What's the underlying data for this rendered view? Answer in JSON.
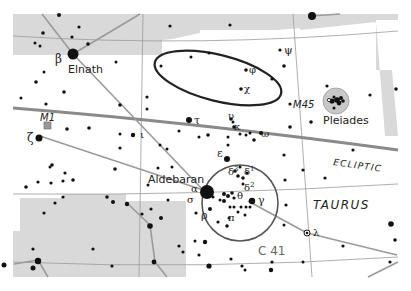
{
  "map": {
    "constellation": "TAURUS",
    "ecliptic_label": "ECLIPTIC",
    "colors": {
      "background": "#ffffff",
      "neighbor_region": "#d9d9d9",
      "grid_line": "#9a9a9a",
      "figure_line": "#9a9a9a",
      "ecliptic": "#8a8a8a",
      "star": "#111111",
      "circle": "#555555",
      "ellipse": "#222222"
    },
    "stars_named": [
      {
        "name": "Elnath",
        "greek": "β"
      },
      {
        "name": "Aldebaran",
        "greek": "α"
      }
    ],
    "greek_labels": [
      "β",
      "ζ",
      "τ",
      "υ",
      "κ",
      "ω",
      "ε",
      "δ³",
      "δ¹",
      "δ²",
      "θ",
      "γ",
      "σ",
      "ρ",
      "π",
      "λ",
      "ψ",
      "φ",
      "χ",
      "ι"
    ],
    "objects": [
      {
        "id": "M1",
        "label": "M1",
        "type": "nebula"
      },
      {
        "id": "M45",
        "label": "M45",
        "name": "Pleiades",
        "type": "open-cluster"
      },
      {
        "id": "C41",
        "label": "C 41",
        "type": "open-cluster-circle"
      }
    ]
  }
}
